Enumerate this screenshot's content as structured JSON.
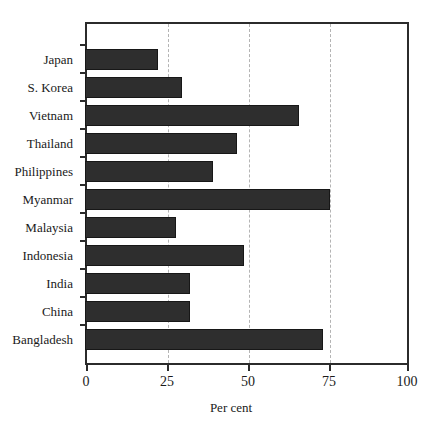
{
  "chart_data": {
    "type": "bar",
    "orientation": "horizontal",
    "title": "",
    "xlabel": "Per cent",
    "ylabel": "",
    "categories": [
      "Japan",
      "S. Korea",
      "Vietnam",
      "Thailand",
      "Philippines",
      "Myanmar",
      "Malaysia",
      "Indonesia",
      "India",
      "China",
      "Bangladesh"
    ],
    "values": [
      22.5,
      30,
      66,
      47,
      39.5,
      75.5,
      28,
      49,
      32.5,
      32.5,
      73.5
    ],
    "xlim": [
      0,
      100
    ],
    "xticks": [
      0,
      25,
      50,
      75,
      100
    ],
    "xtick_labels": [
      "0",
      "25",
      "50",
      "75",
      "100"
    ],
    "grid": "vertical-dashed-at-25-50-75",
    "legend": "none",
    "bar_color": "#2e2e2e",
    "bar_edge_color": "#171717",
    "grid_color": "#b4b4b4",
    "axis_color": "#2b2b2b",
    "background": "#ffffff"
  }
}
